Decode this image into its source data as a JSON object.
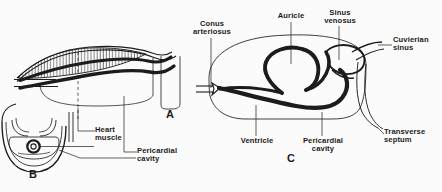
{
  "figure": {
    "background_color": "#fbfbfb",
    "ink_color": "#1c1c1c",
    "panels": [
      {
        "id": "A",
        "plate_label": "A",
        "description": "Longitudinal section showing heart muscle band and pericardial cavity"
      },
      {
        "id": "B",
        "plate_label": "B",
        "description": "Transverse section showing heart in pericardial cavity"
      },
      {
        "id": "C",
        "plate_label": "C",
        "description": "S-shaped heart with named chambers"
      }
    ]
  },
  "labels": {
    "heart_muscle": "Heart\nmuscle",
    "pericardial_cavity_a": "Pericardial\ncavity",
    "conus_arteriosus": "Conus\narteriosus",
    "auricle": "Auricle",
    "sinus_venosus": "Sinus\nvenosus",
    "cuvierian_sinus": "Cuvierian\nsinus",
    "transverse_septum": "Transverse\nseptum",
    "ventricle": "Ventricle",
    "pericardial_cavity_c": "Pericardial\ncavity"
  },
  "plates": {
    "a": "A",
    "b": "B",
    "c": "C"
  }
}
